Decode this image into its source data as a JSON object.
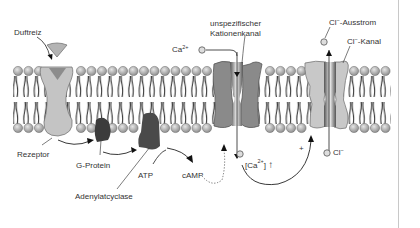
{
  "diagram": {
    "type": "olfactory signal transduction across cell membrane",
    "labels": {
      "duftreiz": "Duftreiz",
      "rezeptor": "Rezeptor",
      "g_protein": "G-Protein",
      "atp": "ATP",
      "adenylatcyclase": "Adenylatcyclase",
      "camp": "cAMP",
      "ca_ion": "Ca",
      "ca_charge": "2+",
      "kanal_line1": "unspezifischer",
      "kanal_line2": "Kationenkanal",
      "ca_conc_open": "[Ca",
      "ca_conc_charge": "2+",
      "ca_conc_close": "]",
      "ca_conc_arrow": "↑",
      "plus": "+",
      "cl_ausstrom_ion": "Cl",
      "cl_ausstrom_charge": "−",
      "cl_ausstrom_text": "-Ausstrom",
      "cl_kanal_ion": "Cl",
      "cl_kanal_charge": "−",
      "cl_kanal_text": "-Kanal",
      "cl_inside_ion": "Cl",
      "cl_inside_charge": "−"
    },
    "colors": {
      "receptor": "#c4c4c4",
      "g_protein": "#3c3c3c",
      "adenylatcyclase": "#4a4a4a",
      "cation_channel": "#8a8a8a",
      "cl_channel": "#c8c8c8",
      "lipid_head": "#b0b0b0",
      "lipid_tail": "#222222"
    }
  }
}
